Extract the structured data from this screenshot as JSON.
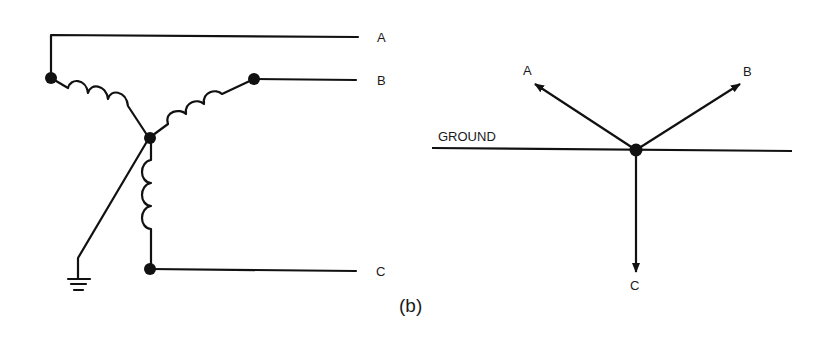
{
  "figure_label": "(b)",
  "schematic": {
    "terminals": [
      {
        "id": "A",
        "label": "A"
      },
      {
        "id": "B",
        "label": "B"
      },
      {
        "id": "C",
        "label": "C"
      }
    ],
    "description": "Wye-connected windings with neutral grounded"
  },
  "phasor": {
    "ground_label": "GROUND",
    "vectors": [
      {
        "id": "A",
        "label": "A"
      },
      {
        "id": "B",
        "label": "B"
      },
      {
        "id": "C",
        "label": "C"
      }
    ]
  },
  "colors": {
    "ink": "#111111",
    "background": "#ffffff"
  }
}
